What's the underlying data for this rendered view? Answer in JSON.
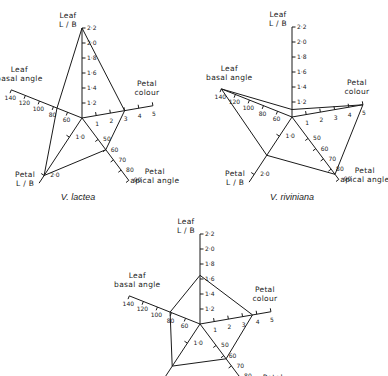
{
  "figure": {
    "axes": [
      {
        "key": "leaf_lb",
        "label_lines": [
          "Leaf",
          "L / B"
        ],
        "ticks": [
          "1·2",
          "1·4",
          "1·6",
          "1·8",
          "2·0",
          "2·2"
        ],
        "min": 1.0,
        "max": 2.2
      },
      {
        "key": "petal_colour",
        "label_lines": [
          "Petal",
          "colour"
        ],
        "ticks": [
          "1",
          "2",
          "3",
          "4",
          "5"
        ],
        "min": 0,
        "max": 5
      },
      {
        "key": "petal_apical_angle",
        "label_lines": [
          "Petal",
          "apical angle"
        ],
        "ticks": [
          "50",
          "60",
          "70",
          "80",
          "90"
        ],
        "min": 40,
        "max": 90
      },
      {
        "key": "petal_lb",
        "label_lines": [
          "Petal",
          "L / B"
        ],
        "ticks": [
          "1·0",
          "2·0"
        ],
        "min": 0.5,
        "max": 2.2
      },
      {
        "key": "leaf_basal_angle",
        "label_lines": [
          "Leaf",
          "basal angle"
        ],
        "ticks": [
          "60",
          "80",
          "100",
          "120",
          "140"
        ],
        "min": 50,
        "max": 140
      }
    ],
    "captions": [
      "V. lactea",
      "V. riviniana",
      ""
    ]
  },
  "chart_data": [
    {
      "type": "radar",
      "title": "V. lactea",
      "axes": [
        "Leaf L/B",
        "Petal colour",
        "Petal apical angle",
        "Petal L/B",
        "Leaf basal angle"
      ],
      "values": {
        "Leaf L/B": 2.2,
        "Petal colour": 3,
        "Petal apical angle": 60,
        "Petal L/B": 2.0,
        "Leaf basal angle": 75
      }
    },
    {
      "type": "radar",
      "title": "V. riviniana",
      "axes": [
        "Leaf L/B",
        "Petal colour",
        "Petal apical angle",
        "Petal L/B",
        "Leaf basal angle"
      ],
      "values": {
        "Leaf L/B": 1.1,
        "Petal colour": 5,
        "Petal apical angle": 85,
        "Petal L/B": 1.5,
        "Leaf basal angle": 140
      }
    },
    {
      "type": "radar",
      "title": "",
      "axes": [
        "Leaf L/B",
        "Petal colour",
        "Petal apical angle",
        "Petal L/B",
        "Leaf basal angle"
      ],
      "values": {
        "Leaf L/B": 1.65,
        "Petal colour": 3.7,
        "Petal apical angle": 63,
        "Petal L/B": 1.6,
        "Leaf basal angle": 82
      }
    }
  ]
}
